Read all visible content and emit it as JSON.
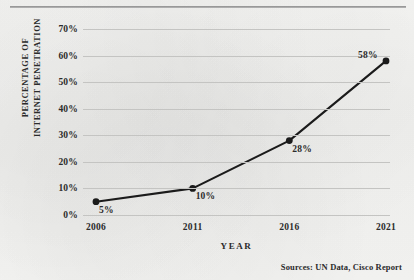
{
  "chart_data": {
    "type": "line",
    "title": "",
    "xlabel": "YEAR",
    "ylabel_line1": "PERCENTAGE OF",
    "ylabel_line2": "INTERNET PENETRATION",
    "categories": [
      "2006",
      "2011",
      "2016",
      "2021"
    ],
    "values": [
      5,
      10,
      28,
      58
    ],
    "point_labels": [
      "5%",
      "10%",
      "28%",
      "58%"
    ],
    "ylim": [
      0,
      70
    ],
    "ytick_labels": [
      "70%",
      "60%",
      "50%",
      "40%",
      "30%",
      "20%",
      "10%",
      "0%"
    ],
    "ytick_values": [
      70,
      60,
      50,
      40,
      30,
      20,
      10,
      0
    ],
    "grid": true,
    "legend": "none",
    "line_color": "#1b1b1b",
    "marker_color": "#1b1b1b",
    "grid_color": "#c4c4c2",
    "background_color": "#f4f4f2"
  },
  "notes": {
    "sources": "Sources:  UN Data, Cisco Report"
  }
}
